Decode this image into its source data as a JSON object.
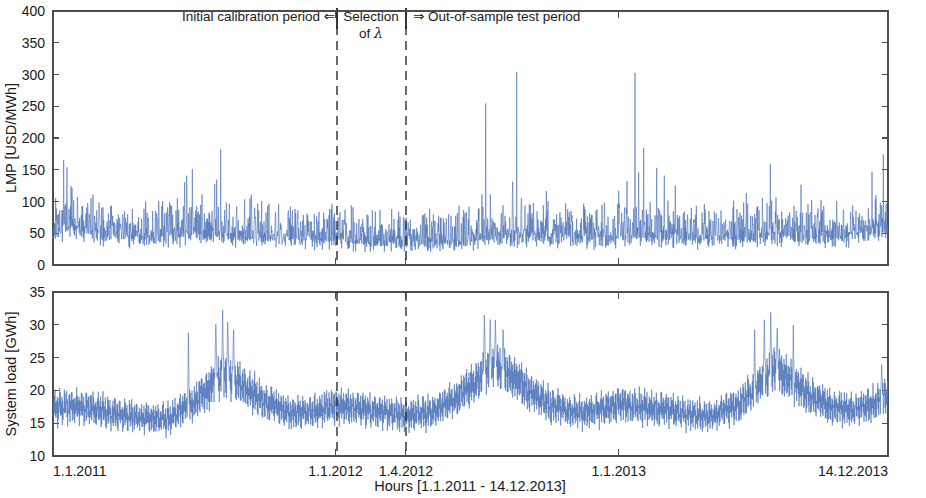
{
  "figure": {
    "width": 926,
    "height": 498,
    "background": "#ffffff",
    "series_color": "#4a72b8",
    "axis_color": "#4d4d4d",
    "divider_color": "#2b2b2b"
  },
  "annotations": {
    "left_label": "Initial calibration period ⇐",
    "center_label_line1": "Selection",
    "center_label_line2_prefix": "of ",
    "center_label_lambda": "λ",
    "right_label": "⇒ Out-of-sample test period",
    "divider_dates": [
      "1.1.2012",
      "1.4.2012"
    ]
  },
  "xaxis": {
    "label": "Hours [1.1.2011 - 14.12.2013]",
    "ticks": [
      {
        "label": "1.1.2011",
        "value": 0
      },
      {
        "label": "1.1.2012",
        "value": 8760
      },
      {
        "label": "1.4.2012",
        "value": 10944
      },
      {
        "label": "1.1.2013",
        "value": 17544
      },
      {
        "label": "14.12.2013",
        "value": 25896
      }
    ],
    "range": [
      0,
      25896
    ],
    "grid": false
  },
  "chart_data": [
    {
      "type": "line",
      "id": "lmp-panel",
      "title": "",
      "ylabel": "LMP [USD/MWh]",
      "xlabel": "",
      "ylim": [
        0,
        400
      ],
      "yticks": [
        0,
        50,
        100,
        150,
        200,
        250,
        300,
        350,
        400
      ],
      "xlim": [
        0,
        25896
      ],
      "grid": false,
      "units": "USD/MWh",
      "series": [
        {
          "name": "LMP",
          "color": "#4a72b8",
          "baseline_mean": 42,
          "noise_amplitude": 17,
          "description": "Hourly locational marginal price with heavy positive spikes, low base around 30-60 USD/MWh",
          "seasonal_baseline": [
            {
              "x": 0,
              "y": 48
            },
            {
              "x": 700,
              "y": 55
            },
            {
              "x": 1500,
              "y": 44
            },
            {
              "x": 2600,
              "y": 40
            },
            {
              "x": 3600,
              "y": 42
            },
            {
              "x": 4400,
              "y": 46
            },
            {
              "x": 5200,
              "y": 44
            },
            {
              "x": 6200,
              "y": 41
            },
            {
              "x": 7400,
              "y": 39
            },
            {
              "x": 8400,
              "y": 38
            },
            {
              "x": 8760,
              "y": 37
            },
            {
              "x": 9600,
              "y": 34
            },
            {
              "x": 10400,
              "y": 33
            },
            {
              "x": 10944,
              "y": 32
            },
            {
              "x": 11800,
              "y": 33
            },
            {
              "x": 12600,
              "y": 35
            },
            {
              "x": 13400,
              "y": 38
            },
            {
              "x": 14200,
              "y": 42
            },
            {
              "x": 15000,
              "y": 40
            },
            {
              "x": 16000,
              "y": 37
            },
            {
              "x": 17000,
              "y": 38
            },
            {
              "x": 17544,
              "y": 41
            },
            {
              "x": 18400,
              "y": 43
            },
            {
              "x": 19400,
              "y": 39
            },
            {
              "x": 20400,
              "y": 37
            },
            {
              "x": 21400,
              "y": 40
            },
            {
              "x": 22400,
              "y": 44
            },
            {
              "x": 23400,
              "y": 42
            },
            {
              "x": 24400,
              "y": 41
            },
            {
              "x": 25896,
              "y": 52
            }
          ],
          "spikes": [
            {
              "x": 430,
              "y": 260,
              "width": 22
            },
            {
              "x": 330,
              "y": 178,
              "width": 26
            },
            {
              "x": 560,
              "y": 150,
              "width": 20
            },
            {
              "x": 760,
              "y": 131,
              "width": 24
            },
            {
              "x": 1180,
              "y": 118,
              "width": 26
            },
            {
              "x": 1720,
              "y": 108,
              "width": 24
            },
            {
              "x": 2250,
              "y": 101,
              "width": 22
            },
            {
              "x": 2950,
              "y": 97,
              "width": 24
            },
            {
              "x": 3680,
              "y": 95,
              "width": 22
            },
            {
              "x": 4150,
              "y": 345,
              "width": 16
            },
            {
              "x": 4080,
              "y": 196,
              "width": 22
            },
            {
              "x": 4320,
              "y": 175,
              "width": 20
            },
            {
              "x": 4620,
              "y": 120,
              "width": 26
            },
            {
              "x": 5080,
              "y": 297,
              "width": 16
            },
            {
              "x": 5010,
              "y": 215,
              "width": 20
            },
            {
              "x": 5200,
              "y": 185,
              "width": 22
            },
            {
              "x": 5380,
              "y": 152,
              "width": 24
            },
            {
              "x": 5700,
              "y": 139,
              "width": 22
            },
            {
              "x": 6150,
              "y": 121,
              "width": 24
            },
            {
              "x": 6700,
              "y": 106,
              "width": 26
            },
            {
              "x": 7300,
              "y": 98,
              "width": 24
            },
            {
              "x": 7900,
              "y": 92,
              "width": 24
            },
            {
              "x": 8500,
              "y": 88,
              "width": 24
            },
            {
              "x": 9100,
              "y": 80,
              "width": 26
            },
            {
              "x": 9900,
              "y": 74,
              "width": 26
            },
            {
              "x": 10600,
              "y": 70,
              "width": 26
            },
            {
              "x": 11400,
              "y": 76,
              "width": 26
            },
            {
              "x": 12200,
              "y": 82,
              "width": 26
            },
            {
              "x": 12900,
              "y": 90,
              "width": 24
            },
            {
              "x": 13300,
              "y": 240,
              "width": 18
            },
            {
              "x": 13420,
              "y": 368,
              "width": 14
            },
            {
              "x": 13560,
              "y": 160,
              "width": 22
            },
            {
              "x": 13900,
              "y": 120,
              "width": 24
            },
            {
              "x": 14260,
              "y": 321,
              "width": 15
            },
            {
              "x": 14380,
              "y": 318,
              "width": 15
            },
            {
              "x": 14520,
              "y": 180,
              "width": 22
            },
            {
              "x": 14800,
              "y": 135,
              "width": 24
            },
            {
              "x": 15300,
              "y": 118,
              "width": 26
            },
            {
              "x": 15900,
              "y": 102,
              "width": 26
            },
            {
              "x": 16500,
              "y": 95,
              "width": 26
            },
            {
              "x": 17100,
              "y": 112,
              "width": 24
            },
            {
              "x": 17544,
              "y": 128,
              "width": 22
            },
            {
              "x": 17800,
              "y": 158,
              "width": 22
            },
            {
              "x": 18050,
              "y": 322,
              "width": 16
            },
            {
              "x": 18160,
              "y": 252,
              "width": 18
            },
            {
              "x": 18320,
              "y": 229,
              "width": 20
            },
            {
              "x": 18520,
              "y": 197,
              "width": 20
            },
            {
              "x": 18720,
              "y": 186,
              "width": 22
            },
            {
              "x": 18960,
              "y": 150,
              "width": 24
            },
            {
              "x": 19300,
              "y": 132,
              "width": 24
            },
            {
              "x": 19800,
              "y": 110,
              "width": 26
            },
            {
              "x": 20400,
              "y": 96,
              "width": 26
            },
            {
              "x": 21000,
              "y": 92,
              "width": 26
            },
            {
              "x": 21500,
              "y": 150,
              "width": 22
            },
            {
              "x": 21900,
              "y": 143,
              "width": 22
            },
            {
              "x": 22250,
              "y": 305,
              "width": 15
            },
            {
              "x": 22420,
              "y": 138,
              "width": 22
            },
            {
              "x": 22800,
              "y": 120,
              "width": 24
            },
            {
              "x": 23200,
              "y": 166,
              "width": 20
            },
            {
              "x": 23700,
              "y": 104,
              "width": 26
            },
            {
              "x": 24300,
              "y": 98,
              "width": 26
            },
            {
              "x": 24900,
              "y": 116,
              "width": 24
            },
            {
              "x": 25400,
              "y": 150,
              "width": 22
            },
            {
              "x": 25750,
              "y": 205,
              "width": 20
            }
          ]
        }
      ]
    },
    {
      "type": "line",
      "id": "load-panel",
      "title": "",
      "ylabel": "System load [GWh]",
      "xlabel": "Hours [1.1.2011 - 14.12.2013]",
      "ylim": [
        10,
        35
      ],
      "yticks": [
        10,
        15,
        20,
        25,
        30,
        35
      ],
      "xlim": [
        0,
        25896
      ],
      "grid": false,
      "units": "GWh",
      "series": [
        {
          "name": "System load",
          "color": "#4a72b8",
          "daily_swing": 2.6,
          "noise_amplitude": 0.55,
          "description": "Hourly system load with strong daily cycle and annual seasonality peaking each summer",
          "seasonal_baseline": [
            {
              "x": 0,
              "y": 17.4
            },
            {
              "x": 500,
              "y": 17.6
            },
            {
              "x": 1200,
              "y": 17.2
            },
            {
              "x": 2000,
              "y": 16.4
            },
            {
              "x": 2800,
              "y": 15.8
            },
            {
              "x": 3500,
              "y": 15.6
            },
            {
              "x": 4200,
              "y": 17.6
            },
            {
              "x": 4700,
              "y": 19.6
            },
            {
              "x": 5100,
              "y": 21.8
            },
            {
              "x": 5400,
              "y": 22.6
            },
            {
              "x": 5700,
              "y": 21.4
            },
            {
              "x": 6100,
              "y": 19.8
            },
            {
              "x": 6700,
              "y": 18.0
            },
            {
              "x": 7400,
              "y": 16.6
            },
            {
              "x": 8100,
              "y": 16.8
            },
            {
              "x": 8760,
              "y": 17.6
            },
            {
              "x": 9400,
              "y": 17.4
            },
            {
              "x": 10200,
              "y": 16.8
            },
            {
              "x": 10944,
              "y": 16.2
            },
            {
              "x": 11600,
              "y": 16.6
            },
            {
              "x": 12300,
              "y": 18.2
            },
            {
              "x": 12900,
              "y": 20.4
            },
            {
              "x": 13400,
              "y": 22.4
            },
            {
              "x": 13700,
              "y": 23.4
            },
            {
              "x": 14000,
              "y": 22.8
            },
            {
              "x": 14400,
              "y": 21.6
            },
            {
              "x": 14900,
              "y": 19.4
            },
            {
              "x": 15500,
              "y": 17.6
            },
            {
              "x": 16200,
              "y": 16.6
            },
            {
              "x": 16900,
              "y": 17.0
            },
            {
              "x": 17544,
              "y": 17.8
            },
            {
              "x": 18200,
              "y": 17.6
            },
            {
              "x": 19000,
              "y": 17.0
            },
            {
              "x": 19700,
              "y": 16.4
            },
            {
              "x": 20400,
              "y": 16.2
            },
            {
              "x": 21100,
              "y": 17.4
            },
            {
              "x": 21700,
              "y": 19.6
            },
            {
              "x": 22100,
              "y": 22.0
            },
            {
              "x": 22400,
              "y": 23.2
            },
            {
              "x": 22700,
              "y": 22.2
            },
            {
              "x": 23100,
              "y": 20.6
            },
            {
              "x": 23600,
              "y": 18.8
            },
            {
              "x": 24200,
              "y": 17.4
            },
            {
              "x": 24900,
              "y": 17.2
            },
            {
              "x": 25400,
              "y": 17.8
            },
            {
              "x": 25896,
              "y": 19.2
            }
          ],
          "spikes": [
            {
              "x": 4200,
              "y": 30.6,
              "width": 30
            },
            {
              "x": 5050,
              "y": 32.0,
              "width": 40
            },
            {
              "x": 5260,
              "y": 33.1,
              "width": 36
            },
            {
              "x": 5420,
              "y": 31.4,
              "width": 40
            },
            {
              "x": 5600,
              "y": 30.2,
              "width": 40
            },
            {
              "x": 13380,
              "y": 32.6,
              "width": 40
            },
            {
              "x": 13560,
              "y": 31.8,
              "width": 40
            },
            {
              "x": 13720,
              "y": 31.2,
              "width": 44
            },
            {
              "x": 13960,
              "y": 30.4,
              "width": 40
            },
            {
              "x": 21760,
              "y": 29.6,
              "width": 36
            },
            {
              "x": 22060,
              "y": 31.0,
              "width": 40
            },
            {
              "x": 22260,
              "y": 33.2,
              "width": 34
            },
            {
              "x": 22460,
              "y": 30.6,
              "width": 40
            },
            {
              "x": 22960,
              "y": 30.0,
              "width": 30
            },
            {
              "x": 25700,
              "y": 24.0,
              "width": 40
            }
          ]
        }
      ]
    }
  ],
  "layout": {
    "plot_left": 53,
    "plot_right": 888,
    "top_panel": {
      "top": 11,
      "bottom": 265
    },
    "bottom_panel": {
      "top": 292,
      "bottom": 456
    },
    "annotation_band_y": 16,
    "annot_rule_x": [
      337,
      406
    ],
    "divider_x": [
      337,
      406
    ]
  }
}
